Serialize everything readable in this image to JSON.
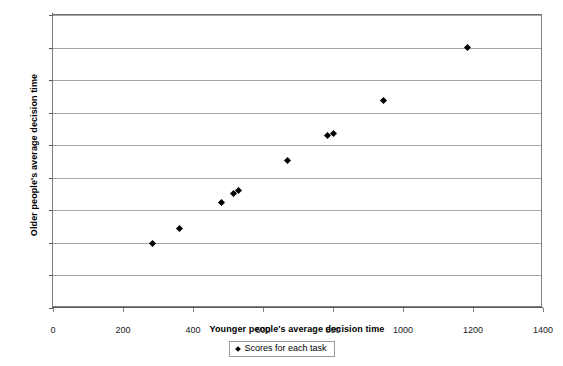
{
  "chart_data": {
    "type": "scatter",
    "title": "",
    "xlabel": "Younger people's average decision time",
    "ylabel": "Older people's average decision time",
    "xlim": [
      0,
      1400
    ],
    "ylim": [
      0,
      1800
    ],
    "xticks": [
      0,
      200,
      400,
      600,
      800,
      1000,
      1200,
      1400
    ],
    "yticks": [
      0,
      200,
      400,
      600,
      800,
      1000,
      1200,
      1400,
      1600,
      1800
    ],
    "grid": "horizontal",
    "legend_position": "bottom",
    "marker": "diamond",
    "marker_color": "#000000",
    "series": [
      {
        "name": "Scores for each task",
        "points": [
          [
            285,
            395
          ],
          [
            360,
            490
          ],
          [
            480,
            650
          ],
          [
            515,
            705
          ],
          [
            530,
            720
          ],
          [
            670,
            905
          ],
          [
            785,
            1060
          ],
          [
            800,
            1075
          ],
          [
            945,
            1275
          ],
          [
            1185,
            1600
          ]
        ]
      }
    ]
  },
  "legend": {
    "entries": [
      {
        "label": "Scores for each task"
      }
    ]
  }
}
